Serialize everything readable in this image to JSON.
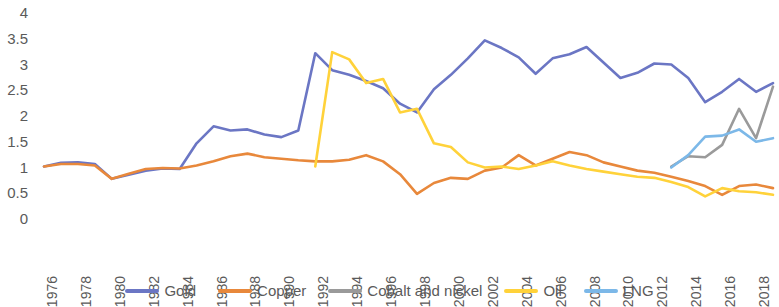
{
  "chart_data": {
    "type": "line",
    "title": "",
    "xlabel": "",
    "ylabel": "",
    "xlim": [
      1976,
      2019
    ],
    "ylim": [
      0,
      4
    ],
    "grid": false,
    "legend_position": "bottom",
    "y_ticks": [
      "0",
      "0.5",
      "1",
      "1.5",
      "2",
      "2.5",
      "3",
      "3.5",
      "4"
    ],
    "y_tick_values": [
      0,
      0.5,
      1,
      1.5,
      2,
      2.5,
      3,
      3.5,
      4
    ],
    "x_tick_labels": [
      "1976",
      "1978",
      "1980",
      "1982",
      "1984",
      "1986",
      "1988",
      "1990",
      "1992",
      "1994",
      "1996",
      "1998",
      "2000",
      "2002",
      "2004",
      "2006",
      "2008",
      "2010",
      "2012",
      "2014",
      "2016",
      "2018"
    ],
    "x_tick_values": [
      1976,
      1978,
      1980,
      1982,
      1984,
      1986,
      1988,
      1990,
      1992,
      1994,
      1996,
      1998,
      2000,
      2002,
      2004,
      2006,
      2008,
      2010,
      2012,
      2014,
      2016,
      2018
    ],
    "series": [
      {
        "name": "Gold",
        "color": "#6b76c4",
        "x": [
          1976,
          1977,
          1978,
          1979,
          1980,
          1981,
          1982,
          1983,
          1984,
          1985,
          1986,
          1987,
          1988,
          1989,
          1990,
          1991,
          1992,
          1993,
          1994,
          1995,
          1996,
          1997,
          1998,
          1999,
          2000,
          2001,
          2002,
          2003,
          2004,
          2005,
          2006,
          2007,
          2008,
          2009,
          2010,
          2011,
          2012,
          2013,
          2014,
          2015,
          2016,
          2017,
          2018,
          2019
        ],
        "values": [
          1.0,
          1.07,
          1.08,
          1.05,
          0.76,
          0.84,
          0.92,
          0.96,
          0.95,
          1.45,
          1.78,
          1.7,
          1.72,
          1.62,
          1.57,
          1.7,
          3.2,
          2.87,
          2.78,
          2.66,
          2.52,
          2.22,
          2.05,
          2.5,
          2.78,
          3.1,
          3.45,
          3.3,
          3.12,
          2.8,
          3.1,
          3.18,
          3.32,
          3.02,
          2.72,
          2.82,
          3.0,
          2.98,
          2.72,
          2.25,
          2.45,
          2.7,
          2.45,
          2.62
        ]
      },
      {
        "name": "Copper",
        "color": "#e8883b",
        "x": [
          1976,
          1977,
          1978,
          1979,
          1980,
          1981,
          1982,
          1983,
          1984,
          1985,
          1986,
          1987,
          1988,
          1989,
          1990,
          1991,
          1992,
          1993,
          1994,
          1995,
          1996,
          1997,
          1998,
          1999,
          2000,
          2001,
          2002,
          2003,
          2004,
          2005,
          2006,
          2007,
          2008,
          2009,
          2010,
          2011,
          2012,
          2013,
          2014,
          2015,
          2016,
          2017,
          2018,
          2019
        ],
        "values": [
          1.0,
          1.05,
          1.05,
          1.02,
          0.76,
          0.86,
          0.95,
          0.97,
          0.96,
          1.02,
          1.1,
          1.2,
          1.25,
          1.18,
          1.15,
          1.12,
          1.1,
          1.1,
          1.13,
          1.22,
          1.1,
          0.85,
          0.47,
          0.68,
          0.78,
          0.76,
          0.92,
          0.98,
          1.22,
          1.02,
          1.15,
          1.28,
          1.22,
          1.08,
          1.0,
          0.92,
          0.88,
          0.8,
          0.72,
          0.62,
          0.45,
          0.62,
          0.65,
          0.58
        ]
      },
      {
        "name": "Cobalt and nickel",
        "color": "#9a9a9a",
        "x": [
          2013,
          2014,
          2015,
          2016,
          2017,
          2018,
          2019
        ],
        "values": [
          1.0,
          1.2,
          1.18,
          1.42,
          2.12,
          1.55,
          2.55
        ]
      },
      {
        "name": "Oil",
        "color": "#ffd23a",
        "x": [
          1992,
          1993,
          1994,
          1995,
          1996,
          1997,
          1998,
          1999,
          2000,
          2001,
          2002,
          2003,
          2004,
          2005,
          2006,
          2007,
          2008,
          2009,
          2010,
          2011,
          2012,
          2013,
          2014,
          2015,
          2016,
          2017,
          2018,
          2019
        ],
        "values": [
          1.0,
          3.22,
          3.08,
          2.62,
          2.7,
          2.05,
          2.12,
          1.45,
          1.38,
          1.08,
          0.98,
          1.0,
          0.95,
          1.02,
          1.1,
          1.02,
          0.95,
          0.9,
          0.85,
          0.8,
          0.78,
          0.7,
          0.6,
          0.42,
          0.58,
          0.52,
          0.5,
          0.45
        ]
      },
      {
        "name": "LNG",
        "color": "#7cb8e8",
        "x": [
          2013,
          2014,
          2015,
          2016,
          2017,
          2018,
          2019
        ],
        "values": [
          0.98,
          1.22,
          1.58,
          1.6,
          1.72,
          1.48,
          1.55
        ]
      }
    ]
  },
  "legend": {
    "items": [
      {
        "label": "Gold",
        "color": "#6b76c4"
      },
      {
        "label": "Copper",
        "color": "#e8883b"
      },
      {
        "label": "Cobalt and nickel",
        "color": "#9a9a9a"
      },
      {
        "label": "Oil",
        "color": "#ffd23a"
      },
      {
        "label": "LNG",
        "color": "#7cb8e8"
      }
    ]
  }
}
